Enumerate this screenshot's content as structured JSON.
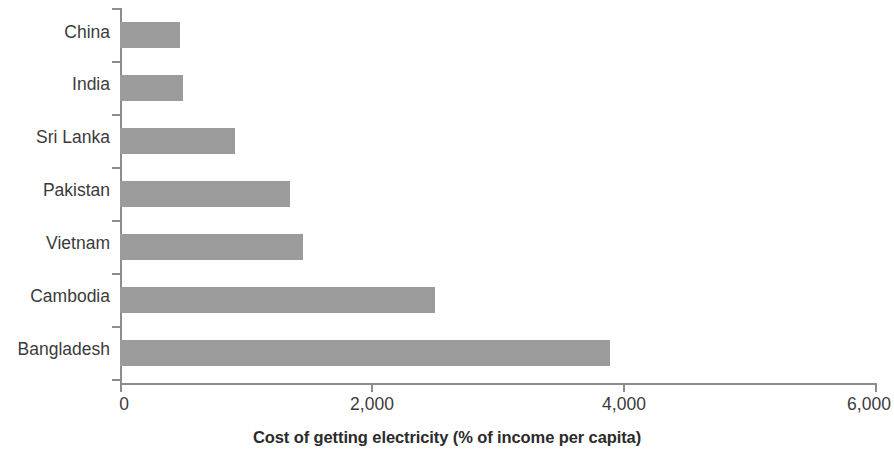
{
  "chart_data": {
    "type": "bar",
    "orientation": "horizontal",
    "title": "",
    "subtitle": "",
    "xlabel": "Cost of getting electricity (% of income per capita)",
    "ylabel": "",
    "categories": [
      "China",
      "India",
      "Sri Lanka",
      "Pakistan",
      "Vietnam",
      "Cambodia",
      "Bangladesh"
    ],
    "values": [
      480,
      500,
      910,
      1350,
      1450,
      2500,
      3890
    ],
    "xlim": [
      0,
      6000
    ],
    "xticks": [
      0,
      2000,
      4000,
      6000
    ],
    "xtick_labels": [
      "0",
      "2,000",
      "4,000",
      "6,000"
    ],
    "grid": false,
    "legend": false,
    "bar_color": "#9b9b9b",
    "axis_color": "#8d8d8d",
    "text_color": "#3b3b3b"
  },
  "axis": {
    "x_title": "Cost of getting electricity (% of income per capita)",
    "tick_0": "0",
    "tick_1": "2,000",
    "tick_2": "4,000",
    "tick_3": "6,000"
  },
  "categories": {
    "c0": "China",
    "c1": "India",
    "c2": "Sri Lanka",
    "c3": "Pakistan",
    "c4": "Vietnam",
    "c5": "Cambodia",
    "c6": "Bangladesh"
  }
}
